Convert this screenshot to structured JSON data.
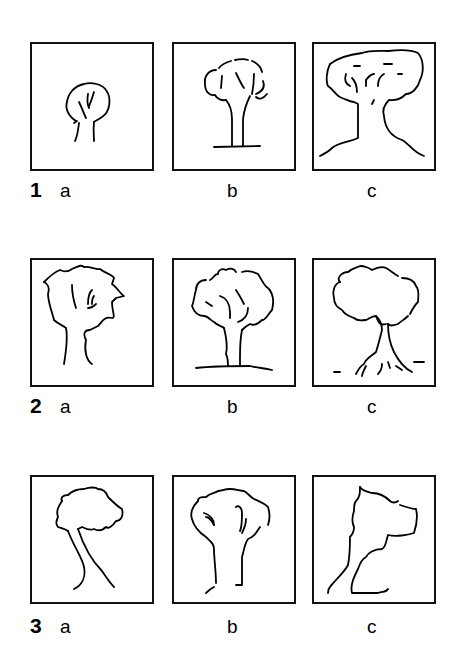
{
  "header": {
    "fragment": ""
  },
  "rows": [
    {
      "number": "1",
      "panels": [
        {
          "letter": "a",
          "icon": "small-round-tree-drawing-icon"
        },
        {
          "letter": "b",
          "icon": "dashed-crown-tree-with-ground-drawing-icon"
        },
        {
          "letter": "c",
          "icon": "large-mushroom-tree-drawing-icon"
        }
      ]
    },
    {
      "number": "2",
      "panels": [
        {
          "letter": "a",
          "icon": "jagged-crown-tree-drawing-icon"
        },
        {
          "letter": "b",
          "icon": "cloud-crown-tree-with-ground-drawing-icon"
        },
        {
          "letter": "c",
          "icon": "cloud-crown-tree-with-roots-drawing-icon"
        }
      ]
    },
    {
      "number": "3",
      "panels": [
        {
          "letter": "a",
          "icon": "leaning-tree-drawing-icon"
        },
        {
          "letter": "b",
          "icon": "open-trunk-tree-drawing-icon"
        },
        {
          "letter": "c",
          "icon": "angular-tree-outline-drawing-icon"
        }
      ]
    }
  ]
}
